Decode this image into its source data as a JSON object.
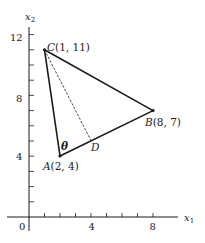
{
  "figure": {
    "type": "geometry-diagram",
    "axes": {
      "x_label": "x",
      "x_label_sub": "1",
      "y_label": "x",
      "y_label_sub": "2",
      "origin_label": "0",
      "x_ticks": [
        1,
        2,
        3,
        4,
        5,
        6,
        7,
        8
      ],
      "x_tick_labels": [
        {
          "value": 4,
          "label": "4"
        },
        {
          "value": 8,
          "label": "8"
        }
      ],
      "y_ticks": [
        1,
        2,
        3,
        4,
        5,
        6,
        7,
        8,
        9,
        10,
        11,
        12
      ],
      "y_tick_labels": [
        {
          "value": 4,
          "label": "4"
        },
        {
          "value": 8,
          "label": "8"
        },
        {
          "value": 12,
          "label": "12"
        }
      ]
    },
    "points": {
      "A": {
        "name": "A",
        "coords": "(2, 4)",
        "x": 2,
        "y": 4
      },
      "B": {
        "name": "B",
        "coords": "(8, 7)",
        "x": 8,
        "y": 7
      },
      "C": {
        "name": "C",
        "coords": "(1, 11)",
        "x": 1,
        "y": 11
      },
      "D": {
        "name": "D",
        "x": 4,
        "y": 5
      }
    },
    "segments": [
      {
        "from": "A",
        "to": "B",
        "style": "solid"
      },
      {
        "from": "B",
        "to": "C",
        "style": "solid"
      },
      {
        "from": "C",
        "to": "A",
        "style": "solid"
      },
      {
        "from": "C",
        "to": "D",
        "style": "dashed"
      }
    ],
    "angle_label": "θ",
    "colors": {
      "ink": "#1a1a1a",
      "background": "#ffffff"
    }
  }
}
